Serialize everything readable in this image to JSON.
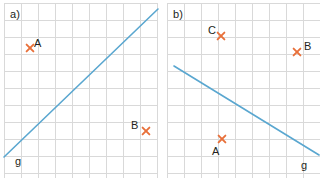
{
  "figure": {
    "background_color": "#ffffff",
    "grid_color": "#d9d9d9",
    "grid_cell_px": 17,
    "line_color": "#5aa7d0",
    "marker_color": "#e8703a",
    "text_color": "#231f20"
  },
  "panels": [
    {
      "id": "a",
      "label": "a)",
      "label_pos": {
        "x": 10,
        "y": 9
      },
      "grid": {
        "x": 4,
        "y": 3,
        "width": 154,
        "height": 175,
        "cols": 9,
        "rows": 10
      },
      "line": {
        "name": "g",
        "label": "g",
        "label_pos": {
          "x": 15,
          "y": 156
        },
        "x1": 4,
        "y1": 157,
        "x2": 158,
        "y2": 9
      },
      "points": [
        {
          "name": "A",
          "label": "A",
          "marker_x": 30,
          "marker_y": 48,
          "label_x": 34,
          "label_y": 38
        },
        {
          "name": "B",
          "label": "B",
          "marker_x": 146,
          "marker_y": 131,
          "label_x": 131,
          "label_y": 120
        }
      ]
    },
    {
      "id": "b",
      "label": "b)",
      "label_pos": {
        "x": 10,
        "y": 9
      },
      "grid": {
        "x": 4,
        "y": 3,
        "width": 153,
        "height": 175,
        "cols": 9,
        "rows": 10
      },
      "line": {
        "name": "g",
        "label": "g",
        "label_pos": {
          "x": 138,
          "y": 160
        },
        "x1": 11,
        "y1": 66,
        "x2": 156,
        "y2": 155
      },
      "points": [
        {
          "name": "C",
          "label": "C",
          "marker_x": 58,
          "marker_y": 36,
          "label_x": 45,
          "label_y": 25
        },
        {
          "name": "B",
          "label": "B",
          "marker_x": 134,
          "marker_y": 52,
          "label_x": 141,
          "label_y": 41
        },
        {
          "name": "A",
          "label": "A",
          "marker_x": 59,
          "marker_y": 139,
          "label_x": 49,
          "label_y": 146
        }
      ]
    }
  ],
  "chart_data": {
    "type": "scatter",
    "title": "",
    "xlabel": "",
    "ylabel": "",
    "subplots": [
      {
        "id": "a",
        "label": "a)",
        "grid": true,
        "grid_cols": 9,
        "grid_rows": 10,
        "line": {
          "name": "g",
          "slope": "positive",
          "from_cell": [
            0,
            9
          ],
          "to_cell": [
            9,
            0
          ]
        },
        "points": [
          {
            "name": "A",
            "cell_x": 1.5,
            "cell_y": 2.6,
            "on_line": false
          },
          {
            "name": "B",
            "cell_x": 8.3,
            "cell_y": 7.3,
            "on_line": false
          }
        ]
      },
      {
        "id": "b",
        "label": "b)",
        "grid": true,
        "grid_cols": 9,
        "grid_rows": 10,
        "line": {
          "name": "g",
          "slope": "negative",
          "from_cell": [
            0.4,
            3.6
          ],
          "to_cell": [
            8.9,
            8.7
          ]
        },
        "points": [
          {
            "name": "C",
            "cell_x": 3.2,
            "cell_y": 1.9,
            "on_line": false
          },
          {
            "name": "B",
            "cell_x": 7.6,
            "cell_y": 2.9,
            "on_line": false
          },
          {
            "name": "A",
            "cell_x": 3.2,
            "cell_y": 8.0,
            "on_line": false
          }
        ]
      }
    ]
  }
}
